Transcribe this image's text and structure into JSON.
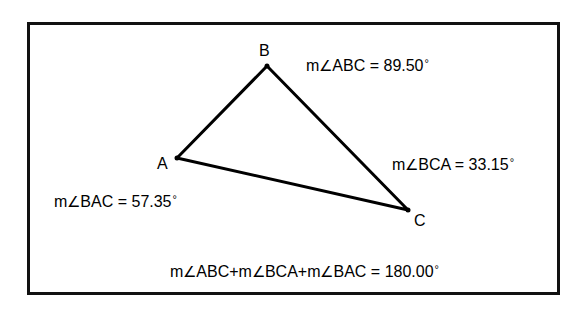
{
  "diagram": {
    "type": "triangle-angle-sum",
    "vertices": [
      {
        "name": "A",
        "x": 177,
        "y": 158
      },
      {
        "name": "B",
        "x": 267,
        "y": 66
      },
      {
        "name": "C",
        "x": 408,
        "y": 210
      }
    ],
    "vertex_labels": {
      "A": "A",
      "B": "B",
      "C": "C"
    },
    "measures": {
      "abc": {
        "prefix": "m",
        "angle_symbol": "∠",
        "name": "ABC",
        "value": "= 89.50",
        "unit": "°"
      },
      "bca": {
        "prefix": "m",
        "angle_symbol": "∠",
        "name": "BCA",
        "value": "= 33.15",
        "unit": "°"
      },
      "bac": {
        "prefix": "m",
        "angle_symbol": "∠",
        "name": "BAC",
        "value": "= 57.35",
        "unit": "°"
      }
    },
    "sum": {
      "p1": "m",
      "s1": "∠",
      "n1": "ABC+",
      "p2": "m",
      "s2": "∠",
      "n2": "BCA+",
      "p3": "m",
      "s3": "∠",
      "n3": "BAC",
      "value": "= 180.00",
      "unit": "°"
    },
    "colors": {
      "line": "#000000",
      "frame": "#111111",
      "background": "#ffffff"
    }
  }
}
